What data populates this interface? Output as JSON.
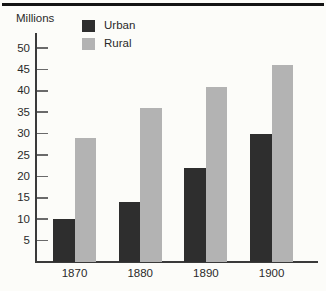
{
  "figure": {
    "unit_label": "Millions"
  },
  "chart_data": {
    "type": "bar",
    "title": "",
    "xlabel": "",
    "ylabel": "Millions",
    "categories": [
      "1870",
      "1880",
      "1890",
      "1900"
    ],
    "series": [
      {
        "name": "Urban",
        "color": "#2e2e2e",
        "values": [
          10,
          14,
          22,
          30
        ]
      },
      {
        "name": "Rural",
        "color": "#b3b3b3",
        "values": [
          29,
          36,
          41,
          46
        ]
      }
    ],
    "ylim": [
      0,
      50
    ],
    "yticks": [
      5,
      10,
      15,
      20,
      25,
      30,
      35,
      40,
      45,
      50
    ],
    "grid": false,
    "legend_position": "top-left-inside",
    "colors": {
      "axis": "#3a3a3a",
      "background": "#fcfcf9",
      "top_rule": "#141414"
    }
  }
}
